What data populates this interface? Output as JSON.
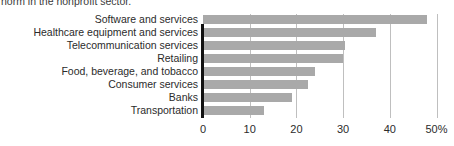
{
  "caption": {
    "text": "norm in the nonprofit sector."
  },
  "chart_data": {
    "type": "bar",
    "orientation": "horizontal",
    "title": "",
    "xlabel": "",
    "ylabel": "",
    "categories": [
      "Software and services",
      "Healthcare equipment and services",
      "Telecommunication services",
      "Retailing",
      "Food, beverage, and tobacco",
      "Consumer services",
      "Banks",
      "Transportation"
    ],
    "values": [
      48,
      37,
      30.5,
      30,
      24,
      22.5,
      19,
      13
    ],
    "xlim": [
      0,
      50
    ],
    "xticks": [
      0,
      10,
      20,
      30,
      40,
      50
    ],
    "xtick_labels": [
      "0",
      "10",
      "20",
      "30",
      "40",
      "50%"
    ],
    "grid": true,
    "grid_axis": "x",
    "legend": false,
    "bar_color": "#a9a9a9",
    "axis_color": "#111111",
    "gridline_color": "#bfbfbf"
  }
}
